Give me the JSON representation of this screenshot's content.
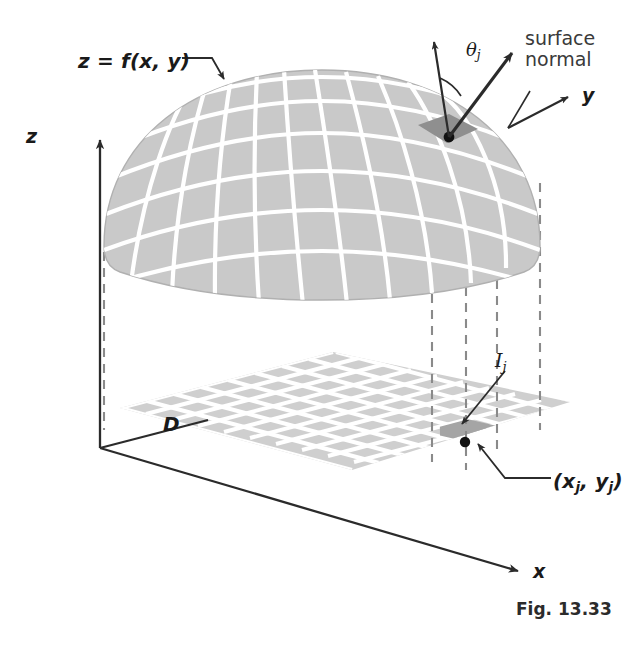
{
  "figure": {
    "caption": "Fig. 13.33",
    "domain_type": "diagram"
  },
  "labels": {
    "surface_equation": "z = f(x, y)",
    "surface_normal_line1": "surface",
    "surface_normal_line2": "normal",
    "theta_symbol": "θ",
    "theta_subscript": "j",
    "axis_x": "x",
    "axis_y": "y",
    "axis_z": "z",
    "region": "D",
    "patch_symbol": "I",
    "patch_subscript": "j",
    "sample_point": "(x",
    "sample_point_sub1": "j",
    "sample_point_mid": ", y",
    "sample_point_sub2": "j",
    "sample_point_end": ")"
  },
  "colors": {
    "surface_fill": "#c9c9c9",
    "surface_grid": "#ffffff",
    "surface_patch_highlight": "#999999",
    "domain_fill": "#cccccc",
    "domain_grid": "#ffffff",
    "domain_patch_highlight": "#a5a5a5",
    "axis_stroke": "#2b2b2b",
    "dashed_stroke": "#808080",
    "label_text": "#1a1a1a",
    "annotation_text": "#3a3a3a",
    "background": "#ffffff"
  },
  "geometry": {
    "origin": [
      100,
      448
    ],
    "z_axis_tip": [
      100,
      136
    ],
    "x_axis_tip": [
      526,
      575
    ],
    "y_axis_arrow_from": [
      508,
      128
    ],
    "y_axis_arrow_to": [
      573,
      94
    ],
    "sample_point_surface": [
      449,
      138
    ],
    "sample_point_domain": [
      465,
      444
    ],
    "normal_arrow_tip": [
      513,
      48
    ],
    "vertical_arrow_tip": [
      434,
      36
    ]
  }
}
